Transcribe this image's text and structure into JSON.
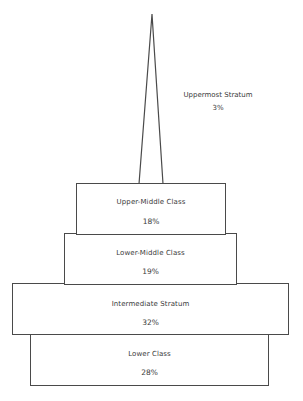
{
  "diagram": {
    "type": "stratification-pyramid",
    "strata": [
      {
        "id": "uppermost",
        "label": "Uppermost Stratum",
        "percent": "3%"
      },
      {
        "id": "upper-middle",
        "label": "Upper-Middle Class",
        "percent": "18%"
      },
      {
        "id": "lower-middle",
        "label": "Lower-Middle Class",
        "percent": "19%"
      },
      {
        "id": "intermediate",
        "label": "Intermediate Stratum",
        "percent": "32%"
      },
      {
        "id": "lower",
        "label": "Lower Class",
        "percent": "28%"
      }
    ]
  }
}
